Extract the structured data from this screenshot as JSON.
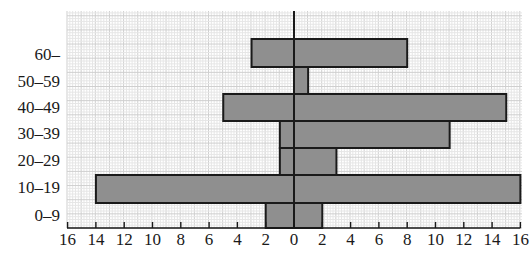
{
  "chart_data": {
    "type": "bar",
    "orientation": "horizontal",
    "layout": "population-pyramid (back-to-back)",
    "title": "",
    "xlabel": "",
    "ylabel": "",
    "categories": [
      "60–",
      "50–59",
      "40–49",
      "30–39",
      "20–29",
      "10–19",
      "0–9"
    ],
    "series": [
      {
        "name": "left",
        "side": "left",
        "values": [
          3,
          0,
          5,
          1,
          1,
          14,
          2
        ]
      },
      {
        "name": "right",
        "side": "right",
        "values": [
          8,
          1,
          15,
          11,
          3,
          16,
          2
        ]
      }
    ],
    "x_ticks": [
      "16",
      "14",
      "12",
      "10",
      "8",
      "6",
      "4",
      "2",
      "0",
      "2",
      "4",
      "6",
      "8",
      "10",
      "12",
      "14",
      "16"
    ],
    "xlim": [
      -16,
      16
    ],
    "grid": true,
    "legend": null,
    "colors": {
      "bar_fill": "#8f8f8f",
      "bar_stroke": "#1a1a1a",
      "grid_minor": "#e6e6e6",
      "grid_major": "#cfcfcf",
      "axis": "#1a1a1a"
    }
  },
  "geometry": {
    "zero_x": 294,
    "px_per_unit": 14.15,
    "grid_left": 67,
    "grid_right": 522,
    "grid_top": 11,
    "axis_y": 228,
    "row_bands": [
      [
        39,
        67
      ],
      [
        67,
        95
      ],
      [
        94,
        121
      ],
      [
        121,
        148
      ],
      [
        148,
        176
      ],
      [
        175,
        203
      ],
      [
        203,
        228
      ]
    ],
    "label_centers": [
      55,
      82,
      108,
      134,
      161,
      188,
      216
    ]
  }
}
